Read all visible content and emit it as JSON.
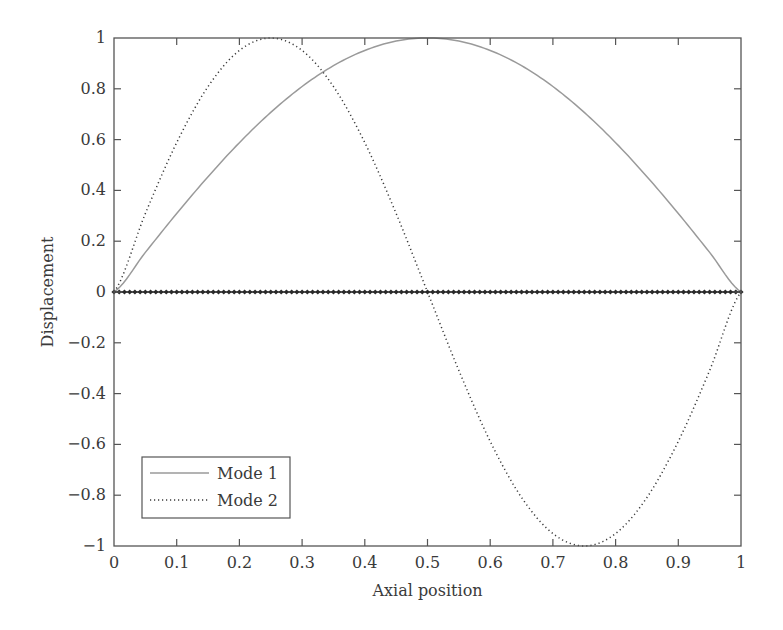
{
  "chart_data": {
    "type": "line",
    "title": "",
    "xlabel": "Axial position",
    "ylabel": "Displacement",
    "xlim": [
      0,
      1
    ],
    "ylim": [
      -1,
      1
    ],
    "grid": false,
    "legend_position": "lower left",
    "xticks": [
      0,
      0.1,
      0.2,
      0.3,
      0.4,
      0.5,
      0.6,
      0.7,
      0.8,
      0.9,
      1
    ],
    "xtick_labels": [
      "0",
      "0.1",
      "0.2",
      "0.3",
      "0.4",
      "0.5",
      "0.6",
      "0.7",
      "0.8",
      "0.9",
      "1"
    ],
    "yticks": [
      -1,
      -0.8,
      -0.6,
      -0.4,
      -0.2,
      0,
      0.2,
      0.4,
      0.6,
      0.8,
      1
    ],
    "ytick_labels": [
      "−1",
      "−0.8",
      "−0.6",
      "−0.4",
      "−0.2",
      "0",
      "0.2",
      "0.4",
      "0.6",
      "0.8",
      "1"
    ],
    "x": [
      0,
      0.05,
      0.1,
      0.15,
      0.2,
      0.25,
      0.3,
      0.35,
      0.4,
      0.45,
      0.5,
      0.55,
      0.6,
      0.65,
      0.7,
      0.75,
      0.8,
      0.85,
      0.9,
      0.95,
      1
    ],
    "series": [
      {
        "name": "Mode 1",
        "style": "solid",
        "color": "#9a9a9a",
        "values": [
          0,
          0.156,
          0.309,
          0.454,
          0.588,
          0.707,
          0.809,
          0.891,
          0.951,
          0.988,
          1,
          0.988,
          0.951,
          0.891,
          0.809,
          0.707,
          0.588,
          0.454,
          0.309,
          0.156,
          0
        ]
      },
      {
        "name": "Mode 2",
        "style": "dotted",
        "color": "#3a3a3a",
        "values": [
          0,
          0.309,
          0.588,
          0.809,
          0.951,
          1,
          0.951,
          0.809,
          0.588,
          0.309,
          0,
          -0.309,
          -0.588,
          -0.809,
          -0.951,
          -1,
          -0.951,
          -0.809,
          -0.588,
          -0.309,
          0
        ]
      },
      {
        "name": "Nodes (zero line)",
        "style": "diamond-markers",
        "color": "#2a2a2a",
        "marker_count": 121,
        "values_constant": 0
      }
    ]
  },
  "legend": {
    "items": [
      {
        "label": "Mode 1",
        "style": "solid",
        "color": "#9a9a9a"
      },
      {
        "label": "Mode 2",
        "style": "dotted",
        "color": "#3a3a3a"
      }
    ]
  },
  "colors": {
    "axis": "#555555",
    "text": "#3a3a3a",
    "background": "#ffffff"
  }
}
